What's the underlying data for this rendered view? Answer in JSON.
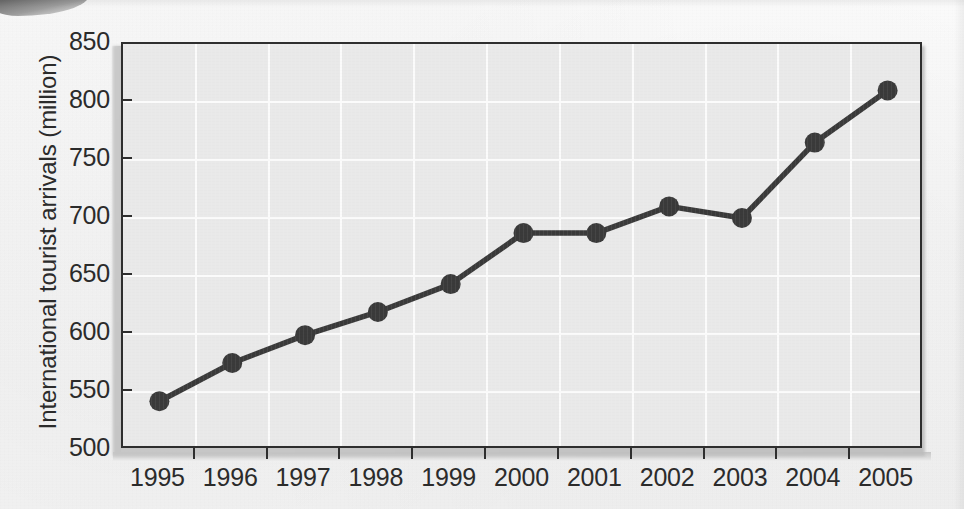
{
  "figure": {
    "background_color": "#f4f4f4",
    "plot_background_color": "#e9e9e9",
    "gridline_color": "#fbfbfb",
    "axis_color": "#2e2e2e",
    "series_color": "#3a3a3a"
  },
  "chart_data": {
    "type": "line",
    "title": "",
    "xlabel": "",
    "ylabel": "International tourist arrivals (million)",
    "categories": [
      "1995",
      "1996",
      "1997",
      "1998",
      "1999",
      "2000",
      "2001",
      "2002",
      "2003",
      "2004",
      "2005"
    ],
    "values": [
      542,
      575,
      599,
      619,
      643,
      687,
      687,
      710,
      700,
      765,
      810
    ],
    "series": [
      {
        "name": "International tourist arrivals",
        "values": [
          542,
          575,
          599,
          619,
          643,
          687,
          687,
          710,
          700,
          765,
          810
        ]
      }
    ],
    "ylim": [
      500,
      850
    ],
    "yticks": [
      500,
      550,
      600,
      650,
      700,
      750,
      800,
      850
    ],
    "ytick_labels": [
      "500",
      "550",
      "600",
      "650",
      "700",
      "750",
      "800",
      "850"
    ],
    "xtick_labels": [
      "1995",
      "1996",
      "1997",
      "1998",
      "1999",
      "2000",
      "2001",
      "2002",
      "2003",
      "2004",
      "2005"
    ],
    "grid": true,
    "legend": false,
    "marker": "circle",
    "line_style": "solid"
  }
}
